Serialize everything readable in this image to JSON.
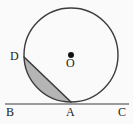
{
  "figure": {
    "kind": "circle-tangent-segment-diagram",
    "background_color": "#fafafa",
    "stroke_color": "#3c3c3c",
    "shade_color": "#a8a8a8",
    "width": 133,
    "height": 124
  },
  "circle": {
    "name": "main-circle",
    "center_x": 71,
    "center_y": 55,
    "radius": 47,
    "center_dot_radius": 3,
    "stroke_width": 1.4
  },
  "tangent_line": {
    "name": "tangent-line-BC",
    "x1": 5,
    "y1": 104,
    "x2": 129,
    "y2": 104,
    "stroke_width": 1.2
  },
  "chord": {
    "name": "chord-DA",
    "x1": 24,
    "y1": 57,
    "x2": 71,
    "y2": 102,
    "stroke_width": 1.6
  },
  "shaded_segment": {
    "name": "circular-segment-DA",
    "description": "region bounded by chord DA and minor arc DA",
    "fill": "#a8a8a8",
    "opacity": 0.85
  },
  "points": {
    "A": {
      "label": "A",
      "x": 71,
      "y": 102,
      "role": "tangent-point"
    },
    "B": {
      "label": "B",
      "x": 9,
      "y": 104,
      "role": "tangent-line-end-left"
    },
    "C": {
      "label": "C",
      "x": 122,
      "y": 104,
      "role": "tangent-line-end-right"
    },
    "D": {
      "label": "D",
      "x": 24,
      "y": 57,
      "role": "point-on-circle"
    },
    "O": {
      "label": "O",
      "x": 71,
      "y": 55,
      "role": "circle-center"
    }
  }
}
